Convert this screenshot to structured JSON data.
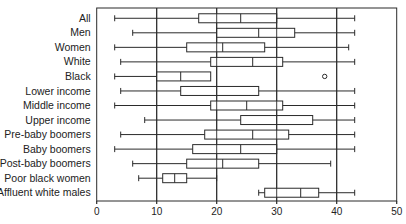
{
  "chart_data": {
    "type": "boxplot",
    "title": "",
    "xlabel": "",
    "ylabel": "",
    "xlim": [
      0,
      50
    ],
    "xticks": [
      0,
      10,
      20,
      30,
      40,
      50
    ],
    "grid": {
      "vertical_lines_at": [
        10,
        20,
        30,
        40
      ]
    },
    "orientation": "horizontal",
    "categories": [
      "All",
      "Men",
      "Women",
      "White",
      "Black",
      "Lower income",
      "Middle income",
      "Upper income",
      "Pre-baby boomers",
      "Baby boomers",
      "Post-baby boomers",
      "Poor black women",
      "Affluent white males"
    ],
    "series": [
      {
        "name": "All",
        "whisker_low": 3,
        "q1": 17,
        "median": 24,
        "q3": 30,
        "whisker_high": 43,
        "outliers": []
      },
      {
        "name": "Men",
        "whisker_low": 6,
        "q1": 20,
        "median": 27,
        "q3": 33,
        "whisker_high": 43,
        "outliers": []
      },
      {
        "name": "Women",
        "whisker_low": 3,
        "q1": 15,
        "median": 21,
        "q3": 28,
        "whisker_high": 42,
        "outliers": []
      },
      {
        "name": "White",
        "whisker_low": 4,
        "q1": 19,
        "median": 26,
        "q3": 31,
        "whisker_high": 43,
        "outliers": []
      },
      {
        "name": "Black",
        "whisker_low": 3,
        "q1": 10,
        "median": 14,
        "q3": 19,
        "whisker_high": 19,
        "outliers": [
          38
        ]
      },
      {
        "name": "Lower income",
        "whisker_low": 4,
        "q1": 14,
        "median": 20,
        "q3": 27,
        "whisker_high": 43,
        "outliers": []
      },
      {
        "name": "Middle income",
        "whisker_low": 3,
        "q1": 19,
        "median": 25,
        "q3": 31,
        "whisker_high": 43,
        "outliers": []
      },
      {
        "name": "Upper income",
        "whisker_low": 8,
        "q1": 24,
        "median": 30,
        "q3": 36,
        "whisker_high": 43,
        "outliers": []
      },
      {
        "name": "Pre-baby boomers",
        "whisker_low": 4,
        "q1": 18,
        "median": 26,
        "q3": 32,
        "whisker_high": 43,
        "outliers": []
      },
      {
        "name": "Baby boomers",
        "whisker_low": 3,
        "q1": 16,
        "median": 24,
        "q3": 30,
        "whisker_high": 43,
        "outliers": []
      },
      {
        "name": "Post-baby boomers",
        "whisker_low": 6,
        "q1": 15,
        "median": 21,
        "q3": 27,
        "whisker_high": 39,
        "outliers": []
      },
      {
        "name": "Poor black women",
        "whisker_low": 7,
        "q1": 11,
        "median": 13,
        "q3": 15,
        "whisker_high": 20,
        "outliers": []
      },
      {
        "name": "Affluent white males",
        "whisker_low": 27,
        "q1": 28,
        "median": 34,
        "q3": 37,
        "whisker_high": 43,
        "outliers": []
      }
    ]
  },
  "style": {
    "line_color": "#2b2b2b",
    "background": "#ffffff"
  }
}
